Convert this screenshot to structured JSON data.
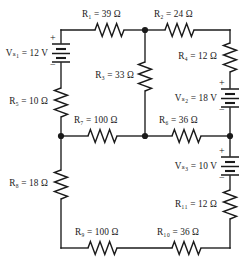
{
  "figure": {
    "kind": "circuit-schematic",
    "width": 247,
    "height": 257,
    "background": "#ffffff",
    "ink": "#1a1a1a"
  },
  "components": {
    "r1": {
      "name": "R",
      "sub": "1",
      "eq": "=",
      "value": "39",
      "unit": "Ω",
      "label": "R₁ = 39 Ω",
      "type": "resistor",
      "orientation": "horizontal"
    },
    "r2": {
      "name": "R",
      "sub": "2",
      "eq": "=",
      "value": "24",
      "unit": "Ω",
      "label": "R₂ = 24 Ω",
      "type": "resistor",
      "orientation": "horizontal"
    },
    "r3": {
      "name": "R",
      "sub": "3",
      "eq": "=",
      "value": "33",
      "unit": "Ω",
      "label": "R₃ = 33 Ω",
      "type": "resistor",
      "orientation": "vertical"
    },
    "r4": {
      "name": "R",
      "sub": "4",
      "eq": "=",
      "value": "12",
      "unit": "Ω",
      "label": "R₄ = 12 Ω",
      "type": "resistor",
      "orientation": "vertical"
    },
    "r5": {
      "name": "R",
      "sub": "5",
      "eq": "=",
      "value": "10",
      "unit": "Ω",
      "label": "R₅ = 10 Ω",
      "type": "resistor",
      "orientation": "vertical"
    },
    "r6": {
      "name": "R",
      "sub": "6",
      "eq": "=",
      "value": "36",
      "unit": "Ω",
      "label": "R₆ = 36 Ω",
      "type": "resistor",
      "orientation": "horizontal"
    },
    "r7": {
      "name": "R",
      "sub": "7",
      "eq": "=",
      "value": "100",
      "unit": "Ω",
      "label": "R₇ = 100 Ω",
      "type": "resistor",
      "orientation": "horizontal"
    },
    "r8": {
      "name": "R",
      "sub": "8",
      "eq": "=",
      "value": "18",
      "unit": "Ω",
      "label": "R₈ = 18 Ω",
      "type": "resistor",
      "orientation": "vertical"
    },
    "r9": {
      "name": "R",
      "sub": "9",
      "eq": "=",
      "value": "100",
      "unit": "Ω",
      "label": "R₉ = 100 Ω",
      "type": "resistor",
      "orientation": "horizontal"
    },
    "r10": {
      "name": "R",
      "sub": "10",
      "eq": "=",
      "value": "36",
      "unit": "Ω",
      "label": "R₁₀ = 36 Ω",
      "type": "resistor",
      "orientation": "horizontal"
    },
    "r11": {
      "name": "R",
      "sub": "11",
      "eq": "=",
      "value": "12",
      "unit": "Ω",
      "label": "R₁₁ = 12 Ω",
      "type": "resistor",
      "orientation": "vertical"
    },
    "vs1": {
      "name": "V",
      "sub": "S1",
      "eq": "=",
      "value": "12",
      "unit": "V",
      "label": "Vₛ₁ = 12 V",
      "type": "battery",
      "orientation": "vertical",
      "plus": "+",
      "minus": "−",
      "plus_position": "top"
    },
    "vs2": {
      "name": "V",
      "sub": "S2",
      "eq": "=",
      "value": "18",
      "unit": "V",
      "label": "Vₛ₂ = 18 V",
      "type": "battery",
      "orientation": "vertical",
      "plus": "+",
      "minus": "−",
      "plus_position": "top"
    },
    "vs3": {
      "name": "V",
      "sub": "S3",
      "eq": "=",
      "value": "10",
      "unit": "V",
      "label": "Vₛ₃ = 10 V",
      "type": "battery",
      "orientation": "vertical",
      "plus": "+",
      "minus": "−",
      "plus_position": "top"
    }
  },
  "signs": {
    "plus": "+",
    "minus": "−"
  },
  "nodes": [
    {
      "id": "node-top-middle",
      "x": 145,
      "y": 30
    },
    {
      "id": "node-mid-left",
      "x": 61,
      "y": 136
    },
    {
      "id": "node-mid-middle",
      "x": 145,
      "y": 136
    },
    {
      "id": "node-mid-right",
      "x": 230,
      "y": 136
    }
  ]
}
